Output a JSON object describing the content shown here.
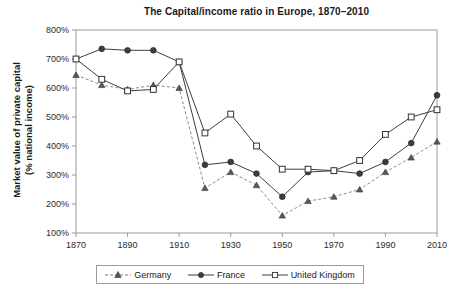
{
  "chart_data": {
    "type": "line",
    "title": "The Capital/income ratio in Europe, 1870–2010",
    "xlabel": "",
    "ylabel": "Market value of private capital (% national income)",
    "ylabel_line1": "Market value of private capital",
    "ylabel_line2": "(% national income)",
    "x": [
      1870,
      1880,
      1890,
      1900,
      1910,
      1920,
      1930,
      1940,
      1950,
      1960,
      1970,
      1980,
      1990,
      2000,
      2010
    ],
    "xlim": [
      1870,
      2010
    ],
    "ylim": [
      100,
      800
    ],
    "ytick_values": [
      100,
      200,
      300,
      400,
      500,
      600,
      700,
      800
    ],
    "ytick_labels": [
      "100%",
      "200%",
      "300%",
      "400%",
      "500%",
      "600%",
      "700%",
      "800%"
    ],
    "xtick_values": [
      1870,
      1890,
      1910,
      1930,
      1950,
      1970,
      1990,
      2010
    ],
    "xtick_labels": [
      "1870",
      "1890",
      "1910",
      "1930",
      "1950",
      "1970",
      "1990",
      "2010"
    ],
    "grid": false,
    "legend_position": "bottom",
    "series": [
      {
        "name": "Germany",
        "marker": "triangle-filled",
        "linestyle": "dashed",
        "color": "#555555",
        "values": [
          645,
          610,
          595,
          610,
          600,
          255,
          310,
          265,
          160,
          210,
          225,
          250,
          310,
          360,
          415
        ]
      },
      {
        "name": "France",
        "marker": "circle-filled",
        "linestyle": "solid",
        "color": "#3d3d3d",
        "values": [
          700,
          735,
          730,
          730,
          690,
          335,
          345,
          305,
          225,
          310,
          315,
          305,
          345,
          410,
          575
        ]
      },
      {
        "name": "United Kingdom",
        "marker": "square-open",
        "linestyle": "solid",
        "color": "#3d3d3d",
        "values": [
          700,
          630,
          590,
          595,
          690,
          445,
          510,
          400,
          320,
          320,
          315,
          350,
          440,
          500,
          525
        ]
      }
    ]
  },
  "legend": {
    "items": [
      {
        "label": "Germany"
      },
      {
        "label": "France"
      },
      {
        "label": "United Kingdom"
      }
    ]
  }
}
